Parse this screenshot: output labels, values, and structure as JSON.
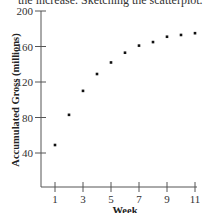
{
  "caption_fragment": "the increase. Sketching the scatterplot.",
  "chart_data": {
    "type": "scatter",
    "title": "",
    "xlabel": "Week",
    "ylabel": "Accumulated Gross (millions)",
    "xlim": [
      0,
      11
    ],
    "ylim": [
      0,
      200
    ],
    "x_ticks": [
      1,
      3,
      5,
      7,
      9,
      11
    ],
    "y_ticks": [
      40,
      80,
      120,
      160,
      200
    ],
    "grid": false,
    "legend": "none",
    "series": [
      {
        "name": "Accumulated Gross",
        "x": [
          1,
          2,
          3,
          4,
          5,
          6,
          7,
          8,
          9,
          10,
          11
        ],
        "y": [
          49,
          83,
          110,
          129,
          142,
          153,
          161,
          165,
          171,
          173,
          175
        ]
      }
    ],
    "colors": {
      "axis": "#555555",
      "point": "#111111",
      "text": "#333333"
    }
  }
}
